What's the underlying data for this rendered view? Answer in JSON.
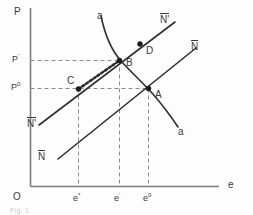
{
  "figure": {
    "type": "economics-diagram",
    "title": "",
    "caption": "Fig. 1",
    "background": "#fdfdfd",
    "ink_color": "#3a3a3a",
    "axes": {
      "y_label": "P",
      "x_label": "e",
      "origin_label": "O",
      "y_ticks": [
        {
          "label_main": "P",
          "label_sup": "'",
          "value_kind": "prime"
        },
        {
          "label_main": "P",
          "label_sup": "0",
          "value_kind": "zero"
        }
      ],
      "x_ticks": [
        {
          "label_main": "e",
          "label_sup": "*"
        },
        {
          "label_main": "e",
          "label_sup": "'"
        },
        {
          "label_main": "e",
          "label_sup": "0"
        }
      ]
    },
    "curves": [
      {
        "name": "a-a",
        "label_top": "a",
        "label_bottom": "a",
        "slope": "downward",
        "style": "solid"
      },
      {
        "name": "N-bar-prime",
        "label_top": "N'",
        "label_bottom": "N'",
        "slope": "upward",
        "style": "solid",
        "overbar": true
      },
      {
        "name": "N-bar",
        "label_top": "N",
        "label_bottom": "N",
        "slope": "upward",
        "style": "solid",
        "overbar": true
      }
    ],
    "points": [
      {
        "id": "A",
        "label": "A"
      },
      {
        "id": "B",
        "label": "B"
      },
      {
        "id": "C",
        "label": "C"
      },
      {
        "id": "D",
        "label": "D"
      }
    ],
    "adjustment_path": {
      "from": "C",
      "to": "B",
      "style": "beaded-dotted"
    },
    "guides": {
      "style": "dashed",
      "color": "#8a8a8a"
    }
  }
}
